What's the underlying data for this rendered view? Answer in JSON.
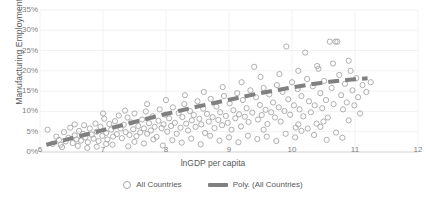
{
  "chart_data": {
    "type": "scatter",
    "title": "",
    "xlabel": "lnGDP per capita",
    "ylabel": "Manufacturing Employment Share",
    "xlim": [
      6,
      12
    ],
    "ylim": [
      0,
      0.35
    ],
    "xticks": [
      "6",
      "7",
      "8",
      "9",
      "10",
      "11",
      "12"
    ],
    "yticks": [
      "0%",
      "5%",
      "10%",
      "15%",
      "20%",
      "25%",
      "30%",
      "35%"
    ],
    "grid": true,
    "legend_position": "bottom",
    "legend": [
      {
        "label": "All Countries",
        "marker": "open-circle",
        "color": "#a6a6a6"
      },
      {
        "label": "Poly. (All Countries)",
        "marker": "dashed-line",
        "color": "#808080"
      }
    ],
    "series": [
      {
        "name": "All Countries",
        "marker": "open-circle",
        "color": "#a6a6a6",
        "points": [
          [
            6.12,
            0.055
          ],
          [
            6.2,
            0.02
          ],
          [
            6.26,
            0.038
          ],
          [
            6.3,
            0.03
          ],
          [
            6.33,
            0.018
          ],
          [
            6.38,
            0.049
          ],
          [
            6.41,
            0.026
          ],
          [
            6.45,
            0.035
          ],
          [
            6.48,
            0.06
          ],
          [
            6.52,
            0.022
          ],
          [
            6.55,
            0.041
          ],
          [
            6.58,
            0.031
          ],
          [
            6.62,
            0.052
          ],
          [
            6.65,
            0.028
          ],
          [
            6.68,
            0.045
          ],
          [
            6.7,
            0.066
          ],
          [
            6.72,
            0.036
          ],
          [
            6.76,
            0.024
          ],
          [
            6.79,
            0.058
          ],
          [
            6.82,
            0.043
          ],
          [
            6.85,
            0.033
          ],
          [
            6.88,
            0.07
          ],
          [
            6.9,
            0.05
          ],
          [
            6.93,
            0.027
          ],
          [
            6.96,
            0.062
          ],
          [
            6.99,
            0.04
          ],
          [
            7.02,
            0.082
          ],
          [
            7.05,
            0.047
          ],
          [
            7.07,
            0.031
          ],
          [
            7.1,
            0.069
          ],
          [
            7.13,
            0.055
          ],
          [
            7.16,
            0.038
          ],
          [
            7.19,
            0.076
          ],
          [
            7.22,
            0.044
          ],
          [
            7.25,
            0.09
          ],
          [
            7.28,
            0.058
          ],
          [
            7.3,
            0.034
          ],
          [
            7.33,
            0.067
          ],
          [
            7.36,
            0.049
          ],
          [
            7.39,
            0.085
          ],
          [
            7.42,
            0.042
          ],
          [
            7.45,
            0.073
          ],
          [
            7.48,
            0.056
          ],
          [
            7.5,
            0.095
          ],
          [
            7.53,
            0.039
          ],
          [
            7.56,
            0.064
          ],
          [
            7.59,
            0.048
          ],
          [
            7.62,
            0.08
          ],
          [
            7.65,
            0.058
          ],
          [
            7.68,
            0.1
          ],
          [
            7.7,
            0.045
          ],
          [
            7.73,
            0.071
          ],
          [
            7.76,
            0.053
          ],
          [
            7.79,
            0.088
          ],
          [
            7.82,
            0.062
          ],
          [
            7.85,
            0.037
          ],
          [
            7.88,
            0.077
          ],
          [
            7.9,
            0.105
          ],
          [
            7.93,
            0.059
          ],
          [
            7.96,
            0.068
          ],
          [
            7.99,
            0.092
          ],
          [
            8.02,
            0.05
          ],
          [
            8.05,
            0.083
          ],
          [
            8.08,
            0.064
          ],
          [
            8.11,
            0.11
          ],
          [
            8.14,
            0.072
          ],
          [
            8.17,
            0.045
          ],
          [
            8.2,
            0.096
          ],
          [
            8.23,
            0.06
          ],
          [
            8.26,
            0.086
          ],
          [
            8.29,
            0.118
          ],
          [
            8.32,
            0.07
          ],
          [
            8.35,
            0.053
          ],
          [
            8.38,
            0.101
          ],
          [
            8.41,
            0.078
          ],
          [
            8.44,
            0.091
          ],
          [
            8.47,
            0.062
          ],
          [
            8.5,
            0.125
          ],
          [
            8.53,
            0.082
          ],
          [
            8.56,
            0.068
          ],
          [
            8.59,
            0.107
          ],
          [
            8.62,
            0.047
          ],
          [
            8.65,
            0.094
          ],
          [
            8.68,
            0.075
          ],
          [
            8.71,
            0.131
          ],
          [
            8.74,
            0.086
          ],
          [
            8.77,
            0.059
          ],
          [
            8.8,
            0.112
          ],
          [
            8.83,
            0.079
          ],
          [
            8.86,
            0.098
          ],
          [
            8.89,
            0.066
          ],
          [
            8.92,
            0.138
          ],
          [
            8.95,
            0.089
          ],
          [
            8.98,
            0.072
          ],
          [
            9.01,
            0.12
          ],
          [
            9.04,
            0.055
          ],
          [
            9.07,
            0.103
          ],
          [
            9.1,
            0.083
          ],
          [
            9.13,
            0.145
          ],
          [
            9.16,
            0.093
          ],
          [
            9.19,
            0.063
          ],
          [
            9.22,
            0.128
          ],
          [
            9.25,
            0.087
          ],
          [
            9.28,
            0.108
          ],
          [
            9.31,
            0.074
          ],
          [
            9.34,
            0.152
          ],
          [
            9.37,
            0.097
          ],
          [
            9.4,
            0.21
          ],
          [
            9.43,
            0.135
          ],
          [
            9.46,
            0.08
          ],
          [
            9.49,
            0.116
          ],
          [
            9.52,
            0.091
          ],
          [
            9.55,
            0.158
          ],
          [
            9.58,
            0.104
          ],
          [
            9.61,
            0.069
          ],
          [
            9.64,
            0.142
          ],
          [
            9.67,
            0.098
          ],
          [
            9.7,
            0.122
          ],
          [
            9.73,
            0.085
          ],
          [
            9.76,
            0.165
          ],
          [
            9.79,
            0.11
          ],
          [
            9.82,
            0.075
          ],
          [
            9.85,
            0.148
          ],
          [
            9.88,
            0.101
          ],
          [
            9.91,
            0.26
          ],
          [
            9.94,
            0.13
          ],
          [
            9.97,
            0.092
          ],
          [
            10.0,
            0.172
          ],
          [
            10.03,
            0.115
          ],
          [
            10.06,
            0.06
          ],
          [
            10.09,
            0.155
          ],
          [
            10.12,
            0.105
          ],
          [
            10.15,
            0.138
          ],
          [
            10.18,
            0.088
          ],
          [
            10.21,
            0.245
          ],
          [
            10.24,
            0.18
          ],
          [
            10.27,
            0.125
          ],
          [
            10.3,
            0.098
          ],
          [
            10.33,
            0.162
          ],
          [
            10.36,
            0.115
          ],
          [
            10.39,
            0.07
          ],
          [
            10.42,
            0.205
          ],
          [
            10.45,
            0.145
          ],
          [
            10.48,
            0.108
          ],
          [
            10.51,
            0.175
          ],
          [
            10.54,
            0.128
          ],
          [
            10.57,
            0.085
          ],
          [
            10.6,
            0.272
          ],
          [
            10.63,
            0.158
          ],
          [
            10.66,
            0.118
          ],
          [
            10.69,
            0.272
          ],
          [
            10.72,
            0.272
          ],
          [
            10.75,
            0.19
          ],
          [
            10.78,
            0.14
          ],
          [
            10.81,
            0.105
          ],
          [
            10.84,
            0.168
          ],
          [
            10.87,
            0.122
          ],
          [
            10.9,
            0.078
          ],
          [
            10.93,
            0.2
          ],
          [
            10.96,
            0.152
          ],
          [
            10.99,
            0.115
          ],
          [
            11.02,
            0.182
          ],
          [
            11.05,
            0.135
          ],
          [
            11.08,
            0.095
          ],
          [
            11.12,
            0.165
          ],
          [
            11.18,
            0.148
          ],
          [
            11.25,
            0.172
          ],
          [
            6.35,
            0.012
          ],
          [
            6.6,
            0.015
          ],
          [
            6.9,
            0.013
          ],
          [
            7.15,
            0.018
          ],
          [
            7.4,
            0.014
          ],
          [
            7.65,
            0.021
          ],
          [
            7.95,
            0.016
          ],
          [
            8.25,
            0.023
          ],
          [
            8.55,
            0.019
          ],
          [
            8.85,
            0.028
          ],
          [
            9.15,
            0.024
          ],
          [
            9.45,
            0.032
          ],
          [
            9.75,
            0.027
          ],
          [
            10.05,
            0.036
          ],
          [
            10.35,
            0.042
          ],
          [
            10.55,
            0.03
          ],
          [
            10.7,
            0.048
          ],
          [
            10.8,
            0.035
          ],
          [
            9.9,
            0.045
          ],
          [
            10.15,
            0.052
          ],
          [
            8.1,
            0.029
          ],
          [
            8.4,
            0.033
          ],
          [
            7.5,
            0.025
          ],
          [
            9.3,
            0.04
          ],
          [
            9.6,
            0.038
          ],
          [
            10.25,
            0.058
          ],
          [
            10.45,
            0.062
          ],
          [
            6.75,
            0.01
          ],
          [
            7.05,
            0.02
          ],
          [
            7.8,
            0.031
          ],
          [
            8.7,
            0.04
          ],
          [
            9.0,
            0.036
          ],
          [
            9.55,
            0.055
          ],
          [
            10.1,
            0.068
          ],
          [
            10.5,
            0.075
          ],
          [
            6.55,
            0.068
          ],
          [
            7.0,
            0.095
          ],
          [
            7.35,
            0.102
          ],
          [
            7.7,
            0.118
          ],
          [
            8.0,
            0.128
          ],
          [
            8.3,
            0.14
          ],
          [
            8.6,
            0.148
          ],
          [
            8.9,
            0.16
          ],
          [
            9.2,
            0.172
          ],
          [
            9.5,
            0.185
          ],
          [
            9.8,
            0.192
          ],
          [
            10.1,
            0.2
          ],
          [
            10.4,
            0.212
          ],
          [
            10.65,
            0.218
          ],
          [
            10.9,
            0.225
          ]
        ]
      }
    ],
    "trendline": {
      "name": "Poly. (All Countries)",
      "style": "dashed",
      "color": "#808080",
      "points": [
        [
          6.1,
          0.018
        ],
        [
          6.4,
          0.03
        ],
        [
          6.7,
          0.042
        ],
        [
          7.0,
          0.054
        ],
        [
          7.3,
          0.066
        ],
        [
          7.6,
          0.078
        ],
        [
          7.9,
          0.09
        ],
        [
          8.2,
          0.101
        ],
        [
          8.5,
          0.112
        ],
        [
          8.8,
          0.122
        ],
        [
          9.1,
          0.132
        ],
        [
          9.4,
          0.142
        ],
        [
          9.7,
          0.151
        ],
        [
          10.0,
          0.159
        ],
        [
          10.3,
          0.167
        ],
        [
          10.6,
          0.173
        ],
        [
          10.9,
          0.178
        ],
        [
          11.2,
          0.182
        ]
      ]
    }
  }
}
